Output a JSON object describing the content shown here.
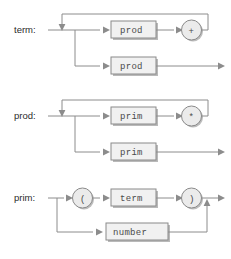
{
  "diagram": {
    "kind": "railroad-syntax-diagram",
    "colors": {
      "background": "#ffffff",
      "wire": "#8c8c8c",
      "box_fill": "#f1f1f1",
      "box_stroke": "#8a8a8a",
      "box_shadow": "#b9b9b9",
      "circle_fill": "#ebebeb",
      "label_text": "#2b2b2b",
      "token_text": "#4a4a4a"
    },
    "rules": [
      {
        "name": "term-rule",
        "label": "term:",
        "upper_branch": {
          "box_label": "prod",
          "operator_label": "+",
          "has_loop_back": true
        },
        "lower_branch": {
          "box_label": "prod",
          "exits_right": true
        }
      },
      {
        "name": "prod-rule",
        "label": "prod:",
        "upper_branch": {
          "box_label": "prim",
          "operator_label": "*",
          "has_loop_back": true
        },
        "lower_branch": {
          "box_label": "prim",
          "exits_right": true
        }
      },
      {
        "name": "prim-rule",
        "label": "prim:",
        "upper_branch": {
          "open_paren_label": "(",
          "box_label": "term",
          "close_paren_label": ")",
          "has_loop_back": false
        },
        "lower_branch": {
          "box_label": "number",
          "exits_right": false,
          "merges_up": true
        }
      }
    ]
  }
}
